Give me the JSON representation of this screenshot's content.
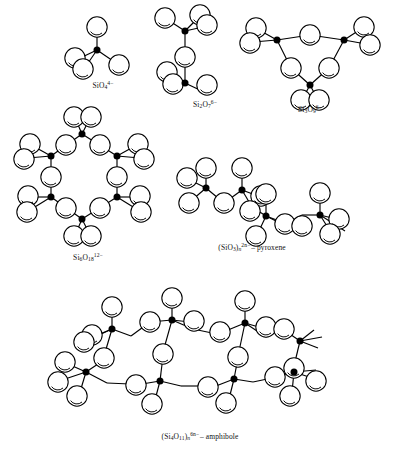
{
  "figure": {
    "background": "#ffffff",
    "ink": "#000000",
    "oxygen_fill": "#ffffff",
    "silicon_fill": "#000000"
  },
  "structures": [
    {
      "id": "orthosilicate",
      "name": "SiO4 tetrahedron",
      "formula_main": "SiO",
      "formula_sub": "4",
      "charge": "4−",
      "suffix": "",
      "label_x": 103,
      "label_y": 86,
      "silicon_count": 1,
      "oxygen_count": 4
    },
    {
      "id": "pyrosilicate",
      "name": "Si2O7 double tetrahedron",
      "formula_main": "Si",
      "formula_sub": "2",
      "formula_main2": "O",
      "formula_sub2": "7",
      "charge": "6−",
      "suffix": "",
      "label_x": 205,
      "label_y": 105,
      "silicon_count": 2,
      "oxygen_count": 7
    },
    {
      "id": "cyclosilicate-3",
      "name": "Si3O9 three-membered ring",
      "formula_main": "Si",
      "formula_sub": "3",
      "formula_main2": "O",
      "formula_sub2": "9",
      "charge": "6−",
      "suffix": "",
      "label_x": 310,
      "label_y": 110,
      "silicon_count": 3,
      "oxygen_count": 9
    },
    {
      "id": "cyclosilicate-6",
      "name": "Si6O18 six-membered ring",
      "formula_main": "Si",
      "formula_sub": "6",
      "formula_main2": "O",
      "formula_sub2": "18",
      "charge": "12−",
      "suffix": "",
      "label_x": 88,
      "label_y": 258,
      "silicon_count": 6,
      "oxygen_count": 18
    },
    {
      "id": "pyroxene",
      "name": "Single chain silicate",
      "formula_open": "(Si",
      "formula_sub": "3",
      "formula_main2": "O",
      "formula_sub2": "",
      "formula_close": ")",
      "formula_n": "n",
      "charge": "2n−",
      "suffix": "– pyroxene",
      "label_x": 252,
      "label_y": 248,
      "silicon_count": 4,
      "oxygen_count": 12
    },
    {
      "id": "amphibole",
      "name": "Double chain silicate",
      "formula_open": "(Si",
      "formula_sub": "4",
      "formula_main2": "O",
      "formula_sub2": "11",
      "formula_close": ")",
      "formula_n": "n",
      "charge": "6n−",
      "suffix": "– amphibole",
      "label_x": 200,
      "label_y": 437,
      "silicon_count": 8,
      "oxygen_count": 24
    }
  ],
  "captions": {
    "orthosilicate": "SiO4 4−",
    "pyrosilicate": "Si2O7 6−",
    "cyclo3": "Si3O9 6−",
    "cyclo6": "Si6O18 12−",
    "pyroxene": "(SiO3)n 2n− – pyroxene",
    "amphibole": "(Si4O11)n 6n− – amphibole"
  },
  "legend": {
    "oxygen_label": "O",
    "silicon_label": "Si"
  }
}
